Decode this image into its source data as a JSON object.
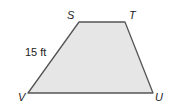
{
  "figure": {
    "shape": "trapezoid",
    "fill_color": "#e6e6e6",
    "stroke_color": "#555555",
    "vertices": [
      {
        "label": "S",
        "x": 79,
        "y": 22
      },
      {
        "label": "T",
        "x": 125,
        "y": 22
      },
      {
        "label": "U",
        "x": 153,
        "y": 93
      },
      {
        "label": "V",
        "x": 28,
        "y": 93
      }
    ],
    "measurements": [
      {
        "side": "SV",
        "label": "15 ft"
      }
    ]
  },
  "labels": {
    "S": "S",
    "T": "T",
    "U": "U",
    "V": "V",
    "side_sv": "15 ft"
  }
}
